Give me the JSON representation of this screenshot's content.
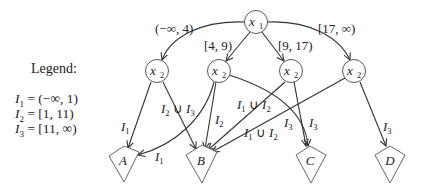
{
  "legend": {
    "title": "Legend:",
    "entries": [
      {
        "var": "I",
        "sub": "1",
        "def": " = (−∞, 1)"
      },
      {
        "var": "I",
        "sub": "2",
        "def": " = [1, 11)"
      },
      {
        "var": "I",
        "sub": "3",
        "def": " = [11, ∞)"
      }
    ]
  },
  "nodes": {
    "root": {
      "var": "x",
      "sub": "1"
    },
    "children": [
      {
        "var": "x",
        "sub": "2"
      },
      {
        "var": "x",
        "sub": "2"
      },
      {
        "var": "x",
        "sub": "2"
      },
      {
        "var": "x",
        "sub": "2"
      }
    ],
    "leaves": [
      "A",
      "B",
      "C",
      "D"
    ]
  },
  "edge_labels": {
    "root_to_c1": "(−∞, 4)",
    "root_to_c2": "[4, 9)",
    "root_to_c3": "[9, 17)",
    "root_to_c4": "[17, ∞)",
    "c1_to_A": {
      "var": "I",
      "sub": "1"
    },
    "c1_to_B": {
      "parts": [
        "I",
        "2",
        " ∪ ",
        "I",
        "3"
      ]
    },
    "c2_to_A": {
      "var": "I",
      "sub": "1"
    },
    "c2_to_B": {
      "var": "I",
      "sub": "2"
    },
    "c2_to_C": {
      "var": "I",
      "sub": "3"
    },
    "c3_to_B": {
      "parts": [
        "I",
        "1",
        " ∪ ",
        "I",
        "2"
      ]
    },
    "c3_to_C": {
      "var": "I",
      "sub": "3"
    },
    "c4_to_B": {
      "parts": [
        "I",
        "1",
        " ∪ ",
        "I",
        "2"
      ]
    },
    "c4_to_D": {
      "var": "I",
      "sub": "3"
    }
  },
  "colors": {
    "stroke": "#333333",
    "text": "#222222",
    "background": "#ffffff"
  }
}
